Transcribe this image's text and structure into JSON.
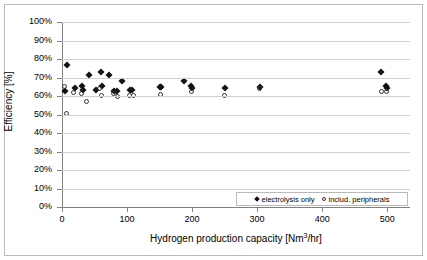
{
  "chart_data": {
    "type": "scatter",
    "title": "",
    "xlabel": "Hydrogen production capacity [Nm3/hr]",
    "ylabel": "Efficiency [%]",
    "xlim": [
      0,
      535
    ],
    "ylim": [
      0,
      100
    ],
    "grid": true,
    "legend_position": "bottom-right",
    "xticks": [
      0,
      100,
      200,
      300,
      400,
      500
    ],
    "xtick_labels": [
      "0",
      "100",
      "200",
      "300",
      "400",
      "500"
    ],
    "yticks": [
      0,
      10,
      20,
      30,
      40,
      50,
      60,
      70,
      80,
      90,
      100
    ],
    "ytick_labels": [
      "0%",
      "10%",
      "20%",
      "30%",
      "40%",
      "50%",
      "60%",
      "70%",
      "80%",
      "90%",
      "100%"
    ],
    "series": [
      {
        "name": "electrolysis only",
        "marker": "filled-diamond",
        "color": "#111111",
        "points": [
          [
            5,
            62.5
          ],
          [
            8,
            76.8
          ],
          [
            20,
            64.5
          ],
          [
            30,
            65.5
          ],
          [
            33,
            63.0
          ],
          [
            42,
            71.5
          ],
          [
            52,
            63.0
          ],
          [
            60,
            73.2
          ],
          [
            62,
            65.5
          ],
          [
            72,
            71.3
          ],
          [
            80,
            62.8
          ],
          [
            84,
            62.6
          ],
          [
            92,
            68.2
          ],
          [
            105,
            63.5
          ],
          [
            108,
            63.2
          ],
          [
            150,
            65.0
          ],
          [
            152,
            64.6
          ],
          [
            188,
            68.3
          ],
          [
            198,
            65.2
          ],
          [
            200,
            64.3
          ],
          [
            250,
            64.5
          ],
          [
            305,
            65.0
          ],
          [
            490,
            73.2
          ],
          [
            498,
            65.2
          ],
          [
            500,
            64.3
          ]
        ]
      },
      {
        "name": "includ. peripherals",
        "marker": "open-circle",
        "color": "#333333",
        "points": [
          [
            4,
            64.8
          ],
          [
            8,
            50.2
          ],
          [
            18,
            61.5
          ],
          [
            30,
            61.2
          ],
          [
            38,
            57.0
          ],
          [
            58,
            64.0
          ],
          [
            62,
            60.0
          ],
          [
            80,
            61.0
          ],
          [
            86,
            59.2
          ],
          [
            105,
            60.2
          ],
          [
            110,
            60.0
          ],
          [
            152,
            60.5
          ],
          [
            200,
            62.2
          ],
          [
            250,
            60.2
          ],
          [
            305,
            63.8
          ],
          [
            492,
            62.3
          ],
          [
            500,
            62.0
          ]
        ]
      }
    ]
  }
}
